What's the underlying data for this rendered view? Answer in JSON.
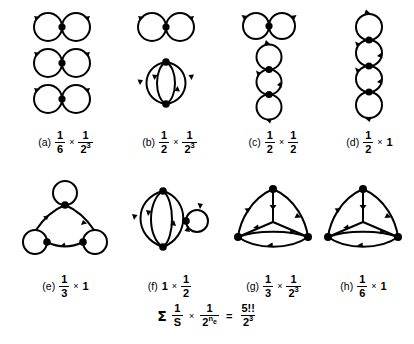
{
  "figure": {
    "type": "feynman-diagram-plate",
    "background_color": "#ffffff",
    "ink_color": "#000000",
    "panels": [
      {
        "id": "a",
        "tag": "(a)",
        "symmetry_factor": {
          "numerator": "1",
          "denominator": "6"
        },
        "edge_factor": {
          "numerator": "1",
          "denominator": "2",
          "denominator_exponent": "3"
        },
        "caption_text": "(a) 1/6 × 1/2^3",
        "graph": {
          "description": "three disconnected figure-eight diagrams (each one vertex with two self-loops)",
          "components": 3,
          "vertices": 3,
          "edges": 6
        }
      },
      {
        "id": "b",
        "tag": "(b)",
        "symmetry_factor": {
          "numerator": "1",
          "denominator": "2"
        },
        "edge_factor": {
          "numerator": "1",
          "denominator": "2",
          "denominator_exponent": "3"
        },
        "caption_text": "(b) 1/2 × 1/2^3",
        "graph": {
          "description": "one figure-eight diagram plus one four-edge banana (two vertices joined by four arcs)",
          "components": 2,
          "vertices": 3,
          "edges": 6
        }
      },
      {
        "id": "c",
        "tag": "(c)",
        "symmetry_factor": {
          "numerator": "1",
          "denominator": "2"
        },
        "edge_factor": {
          "numerator": "1",
          "denominator": "2"
        },
        "caption_text": "(c) 1/2 × 1/2",
        "graph": {
          "description": "one figure-eight diagram plus a vertical chain of three loops (necklace)",
          "components": 2,
          "vertices": 3,
          "edges": 6
        }
      },
      {
        "id": "d",
        "tag": "(d)",
        "symmetry_factor": {
          "numerator": "1",
          "denominator": "2"
        },
        "edge_factor": {
          "numerator": "1",
          "denominator": "1"
        },
        "edge_factor_plain": "1",
        "caption_text": "(d) 1/2 × 1",
        "graph": {
          "description": "vertical necklace chain of four loops sharing three interior vertices",
          "components": 1,
          "vertices": 3,
          "edges": 6
        }
      },
      {
        "id": "e",
        "tag": "(e)",
        "symmetry_factor": {
          "numerator": "1",
          "denominator": "3"
        },
        "edge_factor": {
          "numerator": "1",
          "denominator": "1"
        },
        "edge_factor_plain": "1",
        "caption_text": "(e) 1/3 × 1",
        "graph": {
          "description": "triangle of three vertices, each carrying one self-loop",
          "components": 1,
          "vertices": 3,
          "edges": 6
        }
      },
      {
        "id": "f",
        "tag": "(f)",
        "symmetry_factor_plain": "1",
        "edge_factor": {
          "numerator": "1",
          "denominator": "2"
        },
        "caption_text": "(f) 1 × 1/2",
        "graph": {
          "description": "four-edge banana between two vertices with a third vertex carrying a self-loop on the right",
          "components": 1,
          "vertices": 3,
          "edges": 6
        }
      },
      {
        "id": "g",
        "tag": "(g)",
        "symmetry_factor": {
          "numerator": "1",
          "denominator": "3"
        },
        "edge_factor": {
          "numerator": "1",
          "denominator": "2",
          "denominator_exponent": "3"
        },
        "caption_text": "(g) 1/3 × 1/2^3",
        "graph": {
          "description": "triangle of three vertices with each pair joined by two arcs, inner arcs meeting at centre",
          "components": 1,
          "vertices": 3,
          "edges": 6
        }
      },
      {
        "id": "h",
        "tag": "(h)",
        "symmetry_factor": {
          "numerator": "1",
          "denominator": "6"
        },
        "edge_factor": {
          "numerator": "1",
          "denominator": "1"
        },
        "edge_factor_plain": "1",
        "caption_text": "(h) 1/6 × 1",
        "graph": {
          "description": "triangle of three vertices with each pair joined by two arcs (doubled triangle)",
          "components": 1,
          "vertices": 3,
          "edges": 6
        }
      }
    ],
    "sum_equation": {
      "sigma": "Σ",
      "term1": {
        "numerator": "1",
        "denominator": "S"
      },
      "times": "×",
      "term2": {
        "numerator": "1",
        "denominator": "2",
        "denominator_exponent": "n",
        "denominator_exponent_subscript": "e"
      },
      "equals": "=",
      "result": {
        "numerator": "5!!",
        "denominator": "2",
        "denominator_exponent": "3"
      },
      "plain_text": "Σ 1/S × 1/2^{n_e} = 5!!/2^3"
    }
  }
}
